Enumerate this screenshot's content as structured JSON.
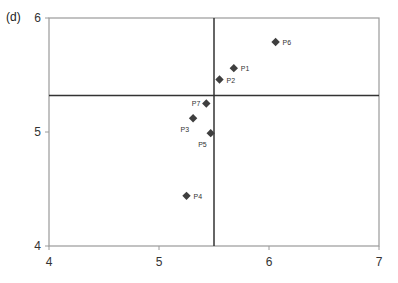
{
  "panel_label": "(d)",
  "chart_data": {
    "type": "scatter",
    "title": "",
    "xlabel": "",
    "ylabel": "",
    "xlim": [
      4,
      7
    ],
    "ylim": [
      4,
      6
    ],
    "x_ticks": [
      4,
      5,
      6,
      7
    ],
    "y_ticks": [
      4,
      5,
      6
    ],
    "grid": false,
    "legend": null,
    "marker": "diamond",
    "marker_color": "#3f3f3f",
    "reference_lines": {
      "vertical_x": 5.5,
      "horizontal_y": 5.32
    },
    "series": [
      {
        "name": "points",
        "points": [
          {
            "label": "P1",
            "x": 5.68,
            "y": 5.56,
            "label_pos": "right"
          },
          {
            "label": "P2",
            "x": 5.55,
            "y": 5.46,
            "label_pos": "right"
          },
          {
            "label": "P3",
            "x": 5.31,
            "y": 5.12,
            "label_pos": "below-left"
          },
          {
            "label": "P4",
            "x": 5.25,
            "y": 4.44,
            "label_pos": "right"
          },
          {
            "label": "P5",
            "x": 5.47,
            "y": 4.99,
            "label_pos": "below-left"
          },
          {
            "label": "P6",
            "x": 6.06,
            "y": 5.79,
            "label_pos": "right"
          },
          {
            "label": "P7",
            "x": 5.43,
            "y": 5.25,
            "label_pos": "left"
          }
        ]
      }
    ]
  }
}
